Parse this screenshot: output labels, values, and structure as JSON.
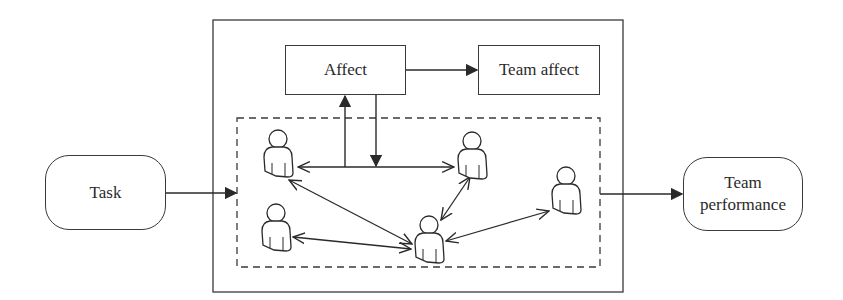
{
  "diagram": {
    "nodes": {
      "task": {
        "label": "Task"
      },
      "affect": {
        "label": "Affect"
      },
      "team_affect": {
        "label": "Team affect"
      },
      "team_performance": {
        "label": "Team performance",
        "line1": "Team",
        "line2": "performance"
      }
    },
    "team_members": 5,
    "edges": [
      {
        "from": "task",
        "to": "team-group",
        "type": "arrow"
      },
      {
        "from": "team-group",
        "to": "team_performance",
        "type": "arrow"
      },
      {
        "from": "affect",
        "to": "team_affect",
        "type": "arrow"
      },
      {
        "from": "team-link",
        "to": "affect",
        "type": "arrow"
      },
      {
        "from": "affect",
        "to": "team-link",
        "type": "arrow"
      },
      {
        "from": "member-1",
        "to": "member-2",
        "type": "bidirectional"
      },
      {
        "from": "member-1",
        "to": "member-5",
        "type": "bidirectional"
      },
      {
        "from": "member-2",
        "to": "member-5",
        "type": "bidirectional"
      },
      {
        "from": "member-4",
        "to": "member-5",
        "type": "bidirectional"
      },
      {
        "from": "member-3",
        "to": "member-5",
        "type": "bidirectional"
      }
    ],
    "colors": {
      "stroke": "#3a3a3a",
      "background": "#ffffff"
    }
  }
}
